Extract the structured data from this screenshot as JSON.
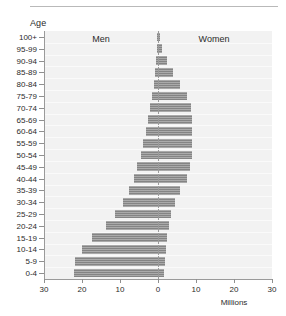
{
  "axis_title": "Age",
  "unit_label": "Millions",
  "series_labels": {
    "left": "Men",
    "right": "Women"
  },
  "colors": {
    "bar": "#8c8c8c",
    "plot_background": "#f2f2f2",
    "axis": "#9a9a9a",
    "text": "#2b2b2b",
    "rule": "#b9b9b9"
  },
  "chart_data": {
    "type": "bar",
    "subtype": "population-pyramid",
    "title": "",
    "xlabel": "Millions",
    "ylabel": "Age",
    "grid": false,
    "legend_position": "inside-top",
    "orientation": "horizontal",
    "xlim": [
      -30,
      30
    ],
    "xticks": [
      30,
      20,
      10,
      0,
      10,
      20,
      30
    ],
    "xtick_labels": [
      "30",
      "20",
      "10",
      "0",
      "10",
      "20",
      "30"
    ],
    "categories": [
      "100+",
      "95-99",
      "90-94",
      "85-89",
      "80-84",
      "75-79",
      "70-74",
      "65-69",
      "60-64",
      "55-59",
      "50-54",
      "45-49",
      "40-44",
      "35-39",
      "30-34",
      "25-29",
      "20-24",
      "15-19",
      "10-14",
      "5-9",
      "0-4"
    ],
    "series": [
      {
        "name": "Men",
        "side": "left",
        "values": [
          0.1,
          0.2,
          0.4,
          0.7,
          1.1,
          1.5,
          2.0,
          2.6,
          3.2,
          3.9,
          4.6,
          5.4,
          6.3,
          7.6,
          9.2,
          11.2,
          13.6,
          17.4,
          20.0,
          21.8,
          22.0
        ]
      },
      {
        "name": "Women",
        "side": "right",
        "values": [
          0.3,
          0.9,
          2.0,
          3.6,
          5.4,
          7.4,
          8.4,
          8.6,
          8.6,
          8.6,
          8.6,
          8.2,
          7.3,
          5.5,
          4.2,
          3.2,
          2.6,
          2.2,
          1.9,
          1.6,
          1.4
        ]
      }
    ]
  }
}
